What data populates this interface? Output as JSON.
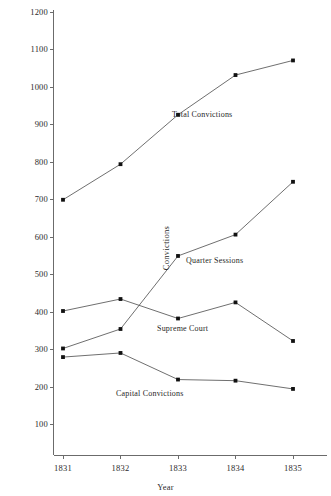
{
  "chart_data": {
    "type": "line",
    "title": "",
    "subtitle": "",
    "xlabel": "Year",
    "ylabel": "Convictions",
    "x": [
      1831,
      1832,
      1833,
      1834,
      1835
    ],
    "categories": [
      "1831",
      "1832",
      "1833",
      "1834",
      "1835"
    ],
    "xtick_labels": [
      "1831",
      "1832",
      "1833",
      "1834",
      "1835"
    ],
    "ytick_labels": [
      "100",
      "200",
      "300",
      "400",
      "500",
      "600",
      "700",
      "800",
      "900",
      "1000",
      "1100",
      "1200"
    ],
    "ytick_values": [
      100,
      200,
      300,
      400,
      500,
      600,
      700,
      800,
      900,
      1000,
      1100,
      1200
    ],
    "ylim": [
      0,
      1200
    ],
    "xlim": [
      1830.6,
      1835.6
    ],
    "grid": false,
    "legend": "inline-annotations",
    "marker": "square",
    "line_color": "#4a4a4a",
    "marker_color": "#111111",
    "series": [
      {
        "name": "Total Convictions",
        "values": [
          700,
          795,
          927,
          1033,
          1072
        ],
        "annotation": "Total Convictions"
      },
      {
        "name": "Quarter Sessions",
        "values": [
          303,
          355,
          550,
          607,
          748
        ],
        "annotation": "Quarter Sessions"
      },
      {
        "name": "Supreme Court",
        "values": [
          403,
          435,
          383,
          426,
          323
        ],
        "annotation": "Supreme Court"
      },
      {
        "name": "Capital Convictions",
        "values": [
          280,
          291,
          220,
          217,
          195
        ],
        "annotation": "Capital Convictions"
      }
    ],
    "annotations": [
      {
        "text": "Total Convictions",
        "x": 172,
        "y": 110
      },
      {
        "text": "Quarter Sessions",
        "x": 186,
        "y": 256
      },
      {
        "text": "Supreme Court",
        "x": 157,
        "y": 324
      },
      {
        "text": "Capital Convictions",
        "x": 116,
        "y": 389
      }
    ]
  }
}
